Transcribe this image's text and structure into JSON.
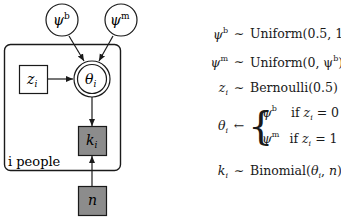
{
  "diagram": {
    "plate_label": "i people",
    "nodes": {
      "psi_b": {
        "label": "ψ",
        "sup": "b",
        "shape": "circle"
      },
      "psi_m": {
        "label": "ψ",
        "sup": "m",
        "shape": "circle"
      },
      "z": {
        "label": "z",
        "sub": "i",
        "shape": "square"
      },
      "theta": {
        "label": "θ",
        "sub": "i",
        "shape": "double-circle"
      },
      "k": {
        "label": "k",
        "sub": "i",
        "shape": "shaded-square"
      },
      "n": {
        "label": "n",
        "shape": "shaded-square"
      }
    },
    "edges": [
      {
        "from": "psi_b",
        "to": "theta"
      },
      {
        "from": "psi_m",
        "to": "theta"
      },
      {
        "from": "z",
        "to": "theta"
      },
      {
        "from": "theta",
        "to": "k"
      },
      {
        "from": "n",
        "to": "k"
      }
    ],
    "colors": {
      "shaded": "#8c8c8c",
      "stroke": "#1a1a1a"
    }
  },
  "equations": {
    "eq1": {
      "lhs": "ψ",
      "lhs_sup": "b",
      "rel": "∼",
      "rhs": "Uniform(0.5, 1)"
    },
    "eq2": {
      "lhs": "ψ",
      "lhs_sup": "m",
      "rel": "∼",
      "rhs_pre": "Uniform(0, ψ",
      "rhs_sup": "b",
      "rhs_post": ")"
    },
    "eq3": {
      "lhs": "z",
      "lhs_sub": "i",
      "rel": "∼",
      "rhs": "Bernoulli(0.5)"
    },
    "eq4": {
      "lhs": "θ",
      "lhs_sub": "i",
      "rel": "←",
      "case1": {
        "val": "ψ",
        "val_sup": "b",
        "cond_if": "if",
        "cond_var": "z",
        "cond_sub": "i",
        "cond_rest": "= 0"
      },
      "case2": {
        "val": "ψ",
        "val_sup": "m",
        "cond_if": "if",
        "cond_var": "z",
        "cond_sub": "i",
        "cond_rest": "= 1"
      }
    },
    "eq5": {
      "lhs": "k",
      "lhs_sub": "i",
      "rel": "∼",
      "rhs_pre": "Binomial(",
      "rhs_theta": "θ",
      "rhs_theta_sub": "i",
      "rhs_post": ", ",
      "rhs_n": "n",
      "rhs_end": ")"
    }
  }
}
